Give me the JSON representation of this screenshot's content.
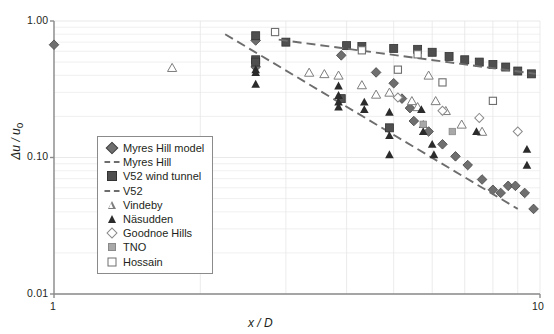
{
  "axes": {
    "y_title": "Δu / u",
    "y_title_sub": "o",
    "x_title": "x / D",
    "y_ticks": [
      "1.00",
      "0.10",
      "0.01"
    ],
    "x_ticks": [
      "1",
      "10"
    ]
  },
  "legend": {
    "items": [
      {
        "label": "Myres Hill model",
        "marker": "diamond-filled",
        "icon_name": "legend-marker-diamond-filled"
      },
      {
        "label": "Myres Hill",
        "marker": "dash-line",
        "icon_name": "legend-marker-dash-line"
      },
      {
        "label": "V52 wind tunnel",
        "marker": "square-filled",
        "icon_name": "legend-marker-square-filled"
      },
      {
        "label": "V52",
        "marker": "dash-line",
        "icon_name": "legend-marker-dash-line"
      },
      {
        "label": "Vindeby",
        "marker": "triangle-open",
        "icon_name": "legend-marker-triangle-open"
      },
      {
        "label": "Näsudden",
        "marker": "triangle-filled",
        "icon_name": "legend-marker-triangle-filled"
      },
      {
        "label": "Goodnoe Hills",
        "marker": "diamond-open",
        "icon_name": "legend-marker-diamond-open"
      },
      {
        "label": "TNO",
        "marker": "square-gray",
        "icon_name": "legend-marker-square-gray"
      },
      {
        "label": "Hossain",
        "marker": "square-open",
        "icon_name": "legend-marker-square-open"
      }
    ]
  },
  "colors": {
    "axis": "#8b8b8b",
    "grid": "#e6e6e6",
    "diamond_filled": "#6f6f6f",
    "square_filled": "#4f4f4f",
    "triangle_open": "#7d7d7d",
    "triangle_filled": "#2b2b2b",
    "diamond_open": "#8a8a8a",
    "square_gray": "#a8a8a8",
    "square_open": "#6e6e6e",
    "trend_line": "#6d6d6d"
  },
  "chart_data": {
    "type": "scatter",
    "title": "",
    "xlabel": "x / D",
    "ylabel": "Δu / u_o",
    "xscale": "log",
    "yscale": "log",
    "xlim": [
      1,
      10
    ],
    "ylim": [
      0.01,
      1.0
    ],
    "grid": true,
    "legend_position": "center-left-inside",
    "series": [
      {
        "name": "Myres Hill model",
        "marker": "diamond-filled",
        "points": [
          [
            1.0,
            0.67
          ],
          [
            2.6,
            0.72
          ],
          [
            2.6,
            0.46
          ],
          [
            3.9,
            0.56
          ],
          [
            4.6,
            0.42
          ],
          [
            5.0,
            0.35
          ],
          [
            5.2,
            0.27
          ],
          [
            5.4,
            0.23
          ],
          [
            5.5,
            0.185
          ],
          [
            5.9,
            0.155
          ],
          [
            6.3,
            0.125
          ],
          [
            6.7,
            0.102
          ],
          [
            7.1,
            0.088
          ],
          [
            7.6,
            0.069
          ],
          [
            8.0,
            0.058
          ],
          [
            8.3,
            0.055
          ],
          [
            8.6,
            0.062
          ],
          [
            8.9,
            0.062
          ],
          [
            9.3,
            0.055
          ],
          [
            9.7,
            0.042
          ]
        ]
      },
      {
        "name": "Myres Hill",
        "marker": "dash-line",
        "type": "trend",
        "endpoints": [
          [
            2.25,
            0.8
          ],
          [
            9.0,
            0.042
          ]
        ]
      },
      {
        "name": "V52 wind tunnel",
        "marker": "square-filled",
        "points": [
          [
            2.6,
            0.78
          ],
          [
            2.6,
            0.52
          ],
          [
            2.6,
            0.5
          ],
          [
            3.0,
            0.7
          ],
          [
            4.0,
            0.66
          ],
          [
            4.3,
            0.65
          ],
          [
            5.0,
            0.63
          ],
          [
            5.6,
            0.62
          ],
          [
            6.0,
            0.59
          ],
          [
            6.5,
            0.55
          ],
          [
            7.0,
            0.52
          ],
          [
            7.5,
            0.5
          ],
          [
            8.0,
            0.48
          ],
          [
            8.5,
            0.46
          ],
          [
            9.0,
            0.43
          ],
          [
            9.6,
            0.41
          ],
          [
            4.9,
            0.165
          ],
          [
            3.9,
            0.27
          ]
        ]
      },
      {
        "name": "V52",
        "marker": "dash-line",
        "type": "trend",
        "endpoints": [
          [
            2.9,
            0.73
          ],
          [
            9.8,
            0.41
          ]
        ]
      },
      {
        "name": "Vindeby",
        "marker": "triangle-open",
        "points": [
          [
            1.75,
            0.455
          ],
          [
            3.35,
            0.42
          ],
          [
            3.6,
            0.41
          ],
          [
            3.85,
            0.4
          ],
          [
            4.3,
            0.34
          ],
          [
            4.6,
            0.29
          ],
          [
            4.9,
            0.3
          ],
          [
            5.45,
            0.26
          ],
          [
            5.6,
            0.235
          ],
          [
            5.9,
            0.4
          ],
          [
            6.1,
            0.26
          ],
          [
            6.4,
            0.22
          ],
          [
            6.9,
            0.175
          ],
          [
            7.6,
            0.155
          ]
        ]
      },
      {
        "name": "Näsudden",
        "marker": "triangle-filled",
        "points": [
          [
            2.6,
            0.44
          ],
          [
            2.6,
            0.42
          ],
          [
            2.6,
            0.345
          ],
          [
            3.85,
            0.335
          ],
          [
            3.85,
            0.285
          ],
          [
            3.85,
            0.255
          ],
          [
            3.85,
            0.235
          ],
          [
            4.35,
            0.255
          ],
          [
            4.35,
            0.225
          ],
          [
            4.9,
            0.215
          ],
          [
            4.9,
            0.145
          ],
          [
            4.9,
            0.105
          ],
          [
            5.7,
            0.225
          ],
          [
            5.75,
            0.175
          ],
          [
            5.75,
            0.155
          ],
          [
            6.0,
            0.125
          ],
          [
            6.05,
            0.105
          ],
          [
            7.4,
            0.155
          ],
          [
            9.4,
            0.115
          ],
          [
            9.4,
            0.088
          ]
        ]
      },
      {
        "name": "Goodnoe Hills",
        "marker": "diamond-open",
        "points": [
          [
            5.1,
            0.275
          ],
          [
            6.3,
            0.22
          ],
          [
            7.5,
            0.195
          ],
          [
            9.0,
            0.155
          ]
        ]
      },
      {
        "name": "TNO",
        "marker": "square-gray",
        "points": [
          [
            5.75,
            0.175
          ],
          [
            6.6,
            0.155
          ]
        ]
      },
      {
        "name": "Hossain",
        "marker": "square-open",
        "points": [
          [
            2.85,
            0.83
          ],
          [
            4.3,
            0.61
          ],
          [
            5.6,
            0.57
          ],
          [
            5.1,
            0.44
          ],
          [
            6.3,
            0.355
          ],
          [
            8.0,
            0.26
          ]
        ]
      }
    ]
  }
}
